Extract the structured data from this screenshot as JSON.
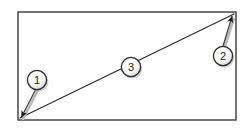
{
  "figure": {
    "background_color": "#ffffff",
    "shape": {
      "name": "rectangle",
      "stroke_color": "#3a3a3a",
      "fill_color": "#ffffff",
      "stroke_width": 1.4,
      "x": 18,
      "y": 12,
      "width": 218,
      "height": 108
    },
    "diagonal": {
      "name": "diagonal-line",
      "stroke_color": "#2b2b2b",
      "stroke_width": 1.2,
      "from_x": 20,
      "from_y": 118,
      "to_x": 234,
      "to_y": 14
    },
    "callouts": [
      {
        "number": "1",
        "circle_x": 37,
        "circle_y": 80,
        "radius": 10,
        "target_x": 21,
        "target_y": 117,
        "has_leader": true,
        "has_arrowhead": true
      },
      {
        "number": "2",
        "circle_x": 223,
        "circle_y": 56,
        "radius": 10,
        "target_x": 232,
        "target_y": 16,
        "has_leader": true,
        "has_arrowhead": true
      },
      {
        "number": "3",
        "circle_x": 131,
        "circle_y": 67,
        "radius": 10,
        "target_x": 131,
        "target_y": 67,
        "has_leader": false,
        "has_arrowhead": false
      }
    ],
    "style": {
      "circle_fill": "#fcfcfc",
      "circle_stroke": "#2b2b2b",
      "circle_stroke_width": 1.3,
      "shadow_color": "#9a9a9a",
      "leader_color": "#4a4a4a",
      "numeral_color": "#1a1a1a"
    }
  }
}
